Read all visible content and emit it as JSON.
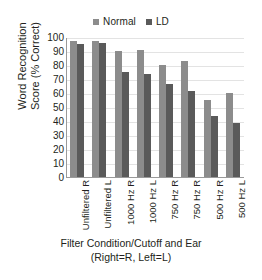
{
  "chart_data": {
    "type": "bar",
    "title": "",
    "xlabel": "Filter Condition/Cutoff and Ear (Right=R, Left=L)",
    "xlabel_lines": [
      "Filter Condition/Cutoff and Ear",
      "(Right=R, Left=L)"
    ],
    "ylabel": "Word Recognition Score (% Correct)",
    "ylabel_lines": [
      "Word Recognition",
      "Score (% Correct)"
    ],
    "categories": [
      "Unfiltered R",
      "Unfiltered L",
      "1000 Hz R",
      "1000 Hz L",
      "750 Hz R",
      "750 Hz R",
      "500 Hz R",
      "500 Hz L"
    ],
    "series": [
      {
        "name": "Normal",
        "color": "#8c8c8c",
        "values": [
          98,
          98,
          90.5,
          91.5,
          81,
          83.5,
          55.5,
          61
        ]
      },
      {
        "name": "LD",
        "color": "#5a5a5a",
        "values": [
          96,
          96.5,
          75.5,
          74.5,
          67,
          62.5,
          44,
          39
        ]
      }
    ],
    "ylim": [
      0,
      100
    ],
    "yticks": [
      100,
      90,
      80,
      70,
      60,
      50,
      40,
      30,
      20,
      10,
      0
    ],
    "ytick_labels": [
      "100",
      "90",
      "80",
      "70",
      "60",
      "50",
      "40",
      "30",
      "20",
      "10",
      "0"
    ],
    "grid": true,
    "grid_axis": "y",
    "legend_position": "top-center",
    "legend": [
      {
        "label": "Normal",
        "color": "#8c8c8c"
      },
      {
        "label": "LD",
        "color": "#5a5a5a"
      }
    ]
  }
}
